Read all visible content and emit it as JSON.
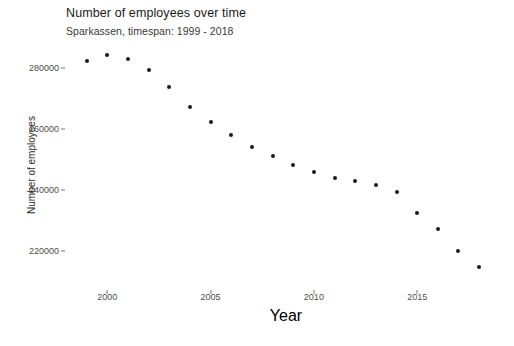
{
  "chart_data": {
    "type": "scatter",
    "title": "Number of employees over time",
    "subtitle": "Sparkassen, timespan: 1999 - 2018",
    "xlabel": "Year",
    "ylabel": "Number of employees",
    "x": [
      1999,
      2000,
      2001,
      2002,
      2003,
      2004,
      2005,
      2006,
      2007,
      2008,
      2009,
      2010,
      2011,
      2012,
      2013,
      2014,
      2015,
      2016,
      2017,
      2018
    ],
    "values": [
      282300,
      284300,
      282900,
      279600,
      273800,
      267400,
      262400,
      258200,
      254000,
      251000,
      248300,
      246000,
      244000,
      243000,
      241500,
      239400,
      232500,
      227200,
      219800,
      214500
    ],
    "xtick_labels": [
      "2000",
      "2005",
      "2010",
      "2015"
    ],
    "xticks": [
      2000,
      2005,
      2010,
      2015
    ],
    "ytick_labels": [
      "220000",
      "240000",
      "260000",
      "280000"
    ],
    "yticks": [
      220000,
      240000,
      260000,
      280000
    ],
    "xlim": [
      1998.0,
      2019.3
    ],
    "ylim": [
      207000,
      288000
    ],
    "grid": false,
    "legend": "none",
    "point_color": "#1b1b1b",
    "background_color": "#ffffff"
  }
}
